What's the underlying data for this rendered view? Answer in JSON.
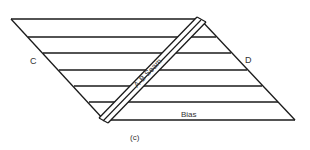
{
  "diagram": {
    "labels": {
      "left_corner": "C",
      "right_corner": "D",
      "seam": "A-B Seam",
      "bias": "Bias",
      "caption": "(c)"
    },
    "colors": {
      "stroke": "#1a1a1a",
      "text": "#333333",
      "background": "#ffffff"
    },
    "shape": "parallelogram with horizontal stripes and diagonal seam",
    "stripe_count": 7
  }
}
